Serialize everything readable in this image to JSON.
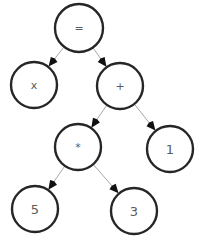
{
  "diagram": {
    "type": "expression-tree",
    "title": "",
    "canvas": {
      "width": 201,
      "height": 240,
      "background": "#ffffff"
    },
    "style": {
      "node_stroke": "#262626",
      "node_fill": "#ffffff",
      "node_stroke_width": 2.4,
      "edge_color": "#a8a8a8",
      "arrow_color": "#111111",
      "label_color": "#5a5a5a",
      "node_radius": 23
    },
    "nodes": [
      {
        "id": "eq",
        "label": "=",
        "kind": "op",
        "cx": 79,
        "cy": 28,
        "r": 24
      },
      {
        "id": "x",
        "label": "x",
        "kind": "var",
        "cx": 34,
        "cy": 85,
        "r": 23
      },
      {
        "id": "plus",
        "label": "+",
        "kind": "op",
        "cx": 120,
        "cy": 86,
        "r": 23
      },
      {
        "id": "times",
        "label": "*",
        "kind": "op",
        "cx": 78,
        "cy": 147,
        "r": 23
      },
      {
        "id": "one",
        "label": "1",
        "kind": "num",
        "cx": 170,
        "cy": 149,
        "r": 23
      },
      {
        "id": "five",
        "label": "5",
        "kind": "num",
        "cx": 35,
        "cy": 209,
        "r": 23
      },
      {
        "id": "three",
        "label": "3",
        "kind": "num",
        "cx": 134,
        "cy": 211,
        "r": 23
      }
    ],
    "edges": [
      {
        "from": "eq",
        "to": "x",
        "label": ""
      },
      {
        "from": "eq",
        "to": "plus",
        "label": ""
      },
      {
        "from": "plus",
        "to": "times",
        "label": ""
      },
      {
        "from": "plus",
        "to": "one",
        "label": ""
      },
      {
        "from": "times",
        "to": "five",
        "label": ""
      },
      {
        "from": "times",
        "to": "three",
        "label": ""
      }
    ]
  }
}
